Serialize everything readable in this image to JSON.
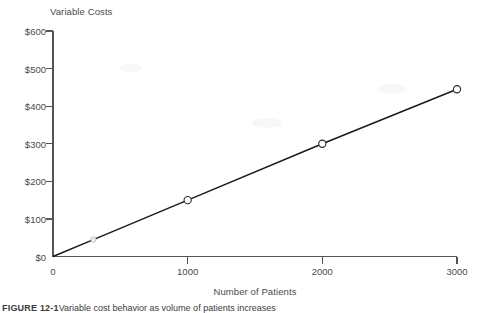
{
  "chart_data": {
    "type": "line",
    "title": "Variable Costs",
    "xlabel": "Number of Patients",
    "ylabel": "",
    "x": [
      0,
      300,
      1000,
      2000,
      3000
    ],
    "values": [
      0,
      45,
      150,
      300,
      445
    ],
    "series": [
      {
        "name": "Variable Costs",
        "x": [
          0,
          300,
          1000,
          2000,
          3000
        ],
        "values": [
          0,
          45,
          150,
          300,
          445
        ]
      }
    ],
    "markers": [
      {
        "x": 300,
        "y": 45,
        "style": "faint"
      },
      {
        "x": 1000,
        "y": 150,
        "style": "open-circle"
      },
      {
        "x": 2000,
        "y": 300,
        "style": "open-circle"
      },
      {
        "x": 3000,
        "y": 445,
        "style": "open-circle"
      }
    ],
    "xlim": [
      0,
      3000
    ],
    "ylim": [
      0,
      600
    ],
    "x_ticks": [
      0,
      1000,
      2000,
      3000
    ],
    "x_tick_labels": [
      "0",
      "1000",
      "2000",
      "3000"
    ],
    "y_ticks": [
      0,
      100,
      200,
      300,
      400,
      500,
      600
    ],
    "y_tick_labels": [
      "$0",
      "$100",
      "$200",
      "$300",
      "$400",
      "$500",
      "$600"
    ],
    "grid": false,
    "legend": null,
    "line_color": "#1a1a1a",
    "axis_color": "#555555",
    "marker_fill": "#ffffff"
  },
  "caption": {
    "label": "FIGURE 12-1",
    "text": "Variable cost behavior as volume of patients increases"
  }
}
